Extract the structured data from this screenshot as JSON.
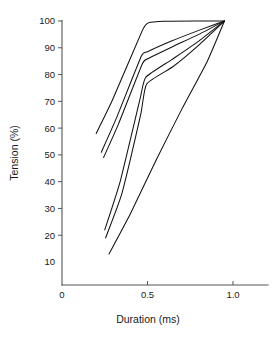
{
  "chart_data": {
    "type": "line",
    "title": "",
    "xlabel": "Duration (ms)",
    "ylabel": "Tension (%)",
    "xlim": [
      0,
      1.12
    ],
    "ylim": [
      5,
      103
    ],
    "grid": false,
    "legend": null,
    "xticks": [
      0,
      0.5,
      1.0
    ],
    "xtick_labels": [
      "0",
      "0.5",
      "1.0"
    ],
    "yticks": [
      10,
      20,
      30,
      40,
      50,
      60,
      70,
      80,
      90,
      100
    ],
    "ytick_labels": [
      "10",
      "20",
      "30",
      "40",
      "50",
      "60",
      "70",
      "80",
      "90",
      "100"
    ],
    "line_color": "#111111",
    "convergence_point": [
      0.95,
      100
    ],
    "series": [
      {
        "name": "curve-1",
        "x": [
          0.2,
          0.295,
          0.47,
          0.505,
          0.6,
          0.78,
          0.95
        ],
        "y": [
          58.0,
          70.5,
          96.5,
          99.3,
          99.9,
          100.0,
          100.0
        ]
      },
      {
        "name": "curve-2",
        "x": [
          0.23,
          0.32,
          0.465,
          0.5,
          0.64,
          0.8,
          0.95
        ],
        "y": [
          51.0,
          64.0,
          87.0,
          88.5,
          92.5,
          96.5,
          100.0
        ]
      },
      {
        "name": "curve-3",
        "x": [
          0.243,
          0.33,
          0.47,
          0.505,
          0.65,
          0.8,
          0.95
        ],
        "y": [
          49.0,
          61.5,
          84.0,
          86.0,
          90.5,
          95.0,
          100.0
        ]
      },
      {
        "name": "curve-4",
        "x": [
          0.25,
          0.34,
          0.455,
          0.49,
          0.64,
          0.8,
          0.95
        ],
        "y": [
          22.0,
          40.0,
          70.5,
          79.0,
          85.5,
          92.5,
          100.0
        ]
      },
      {
        "name": "curve-5",
        "x": [
          0.255,
          0.35,
          0.46,
          0.495,
          0.65,
          0.8,
          0.95
        ],
        "y": [
          19.0,
          35.5,
          65.0,
          76.5,
          83.0,
          91.0,
          100.0
        ]
      },
      {
        "name": "curve-6",
        "x": [
          0.275,
          0.4,
          0.55,
          0.7,
          0.85,
          0.95
        ],
        "y": [
          13.0,
          28.0,
          48.0,
          67.0,
          85.0,
          100.0
        ]
      }
    ]
  }
}
